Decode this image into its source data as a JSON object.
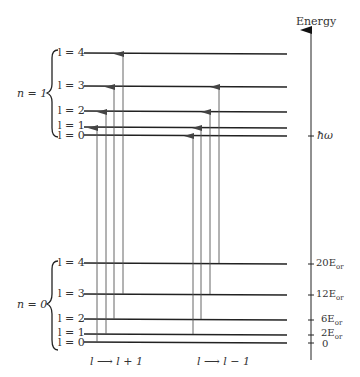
{
  "axis": {
    "title": "Energy",
    "ticks": [
      {
        "label": "ħω",
        "y": 135
      },
      {
        "label": "20E",
        "sub": "or",
        "y": 263
      },
      {
        "label": "12E",
        "sub": "or",
        "y": 294
      },
      {
        "label": "6E",
        "sub": "or",
        "y": 319
      },
      {
        "label": "2E",
        "sub": "or",
        "y": 334
      },
      {
        "label": "0",
        "y": 342
      }
    ]
  },
  "groups": [
    {
      "label": "n = 1",
      "levels": [
        {
          "label": "l = 4",
          "y": 53
        },
        {
          "label": "l = 3",
          "y": 86
        },
        {
          "label": "l = 2",
          "y": 111
        },
        {
          "label": "l = 1",
          "y": 127
        },
        {
          "label": "l = 0",
          "y": 135
        }
      ]
    },
    {
      "label": "n = 0",
      "levels": [
        {
          "label": "l = 4",
          "y": 263
        },
        {
          "label": "l = 3",
          "y": 294
        },
        {
          "label": "l = 2",
          "y": 319
        },
        {
          "label": "l = 1",
          "y": 334
        },
        {
          "label": "l = 0",
          "y": 342
        }
      ]
    }
  ],
  "transitions": {
    "raising": {
      "label": "l → l + 1",
      "arrows": [
        {
          "from": "n=0,l=0",
          "to": "n=1,l=1",
          "x": 97
        },
        {
          "from": "n=0,l=1",
          "to": "n=1,l=2",
          "x": 106
        },
        {
          "from": "n=0,l=2",
          "to": "n=1,l=3",
          "x": 114
        },
        {
          "from": "n=0,l=3",
          "to": "n=1,l=4",
          "x": 123
        }
      ]
    },
    "lowering": {
      "label": "l → l − 1",
      "arrows": [
        {
          "from": "n=0,l=1",
          "to": "n=1,l=0",
          "x": 193
        },
        {
          "from": "n=0,l=2",
          "to": "n=1,l=1",
          "x": 201
        },
        {
          "from": "n=0,l=3",
          "to": "n=1,l=2",
          "x": 210
        },
        {
          "from": "n=0,l=4",
          "to": "n=1,l=3",
          "x": 219
        }
      ]
    }
  },
  "text": {
    "energy": "Energy",
    "n1": "n = 1",
    "n0": "n = 0",
    "l4": "l = 4",
    "l3": "l = 3",
    "l2": "l = 2",
    "l1": "l = 1",
    "l0": "l = 0",
    "hbar_omega": "ħω",
    "t20": "20E",
    "t12": "12E",
    "t6": "6E",
    "t2": "2E",
    "t0": "0",
    "sub": "or",
    "raise": "l ⟶ l + 1",
    "lower": "l ⟶ l − 1"
  }
}
